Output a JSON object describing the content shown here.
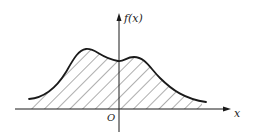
{
  "diagram": {
    "type": "function-area-plot",
    "y_axis_label": "f(x)",
    "x_axis_label": "x",
    "origin_label": "O",
    "curve": {
      "shape": "bimodal",
      "peaks": [
        "left peak (higher, x<0)",
        "right peak (lower, x>0)"
      ],
      "region_under_curve": "hatched"
    },
    "colors": {
      "stroke": "#1a1a1a",
      "hatch": "#333333",
      "background": "#ffffff"
    }
  }
}
